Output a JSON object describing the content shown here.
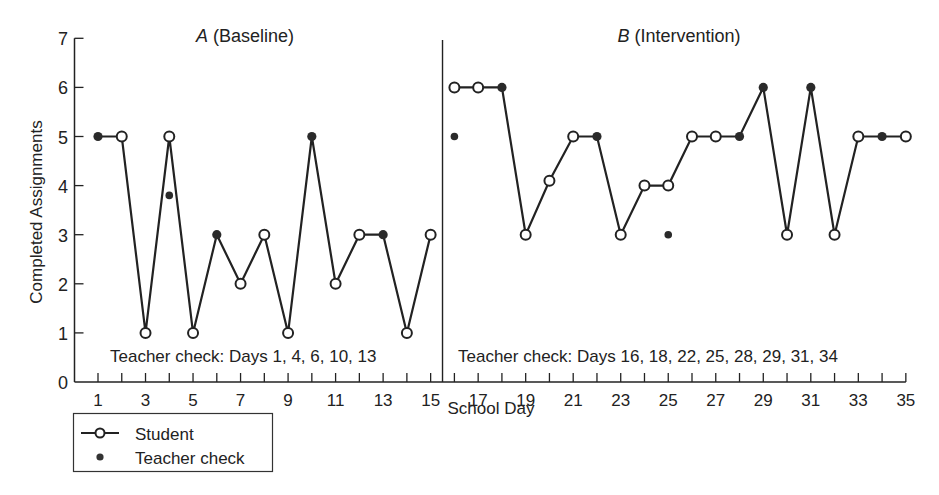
{
  "chart_data": {
    "type": "line",
    "title": "",
    "xlabel": "School Day",
    "ylabel": "Completed Assignments",
    "ylim": [
      0,
      7
    ],
    "xlim": [
      0,
      35
    ],
    "grid": false,
    "y_ticks": [
      0,
      1,
      2,
      3,
      4,
      5,
      6,
      7
    ],
    "x_tick_labels": [
      1,
      3,
      5,
      7,
      9,
      11,
      13,
      15,
      17,
      19,
      21,
      23,
      25,
      27,
      29,
      31,
      33,
      35
    ],
    "phases": [
      {
        "label_italic": "A",
        "label_rest": " (Baseline)",
        "days": [
          1,
          15
        ],
        "annotation": "Teacher check: Days 1, 4, 6, 10, 13"
      },
      {
        "label_italic": "B",
        "label_rest": " (Intervention)",
        "days": [
          16,
          35
        ],
        "annotation": "Teacher check: Days 16, 18, 22, 25, 28, 29, 31, 34"
      }
    ],
    "phase_change_after_day": 15,
    "series": [
      {
        "name": "Student",
        "marker": "open-circle",
        "segments": [
          {
            "x": [
              1,
              2,
              3,
              4,
              5,
              6,
              7,
              8,
              9,
              10,
              11,
              12,
              13,
              14,
              15
            ],
            "y": [
              5,
              5,
              1,
              5,
              1,
              3,
              2,
              3,
              1,
              5,
              2,
              3,
              3,
              1,
              3
            ]
          },
          {
            "x": [
              16,
              17,
              18,
              19,
              20,
              21,
              22,
              23,
              24,
              25,
              26,
              27,
              28,
              29,
              30,
              31,
              32,
              33,
              34,
              35
            ],
            "y": [
              6,
              6,
              6,
              3,
              4.1,
              5,
              5,
              3,
              4,
              4,
              5,
              5,
              5,
              6,
              3,
              6,
              3,
              5,
              5,
              5
            ]
          }
        ]
      },
      {
        "name": "Teacher check",
        "marker": "filled-dot",
        "x": [
          1,
          4,
          6,
          10,
          13,
          16,
          18,
          22,
          25,
          28,
          29,
          31,
          34
        ],
        "y": [
          5,
          3.8,
          3,
          5,
          3,
          5,
          6,
          5,
          3,
          5,
          6,
          6,
          5
        ]
      }
    ],
    "legend": {
      "position": "bottom-left",
      "entries": [
        "Student",
        "Teacher check"
      ]
    }
  },
  "colors": {
    "line": "#222222",
    "background": "#ffffff"
  }
}
